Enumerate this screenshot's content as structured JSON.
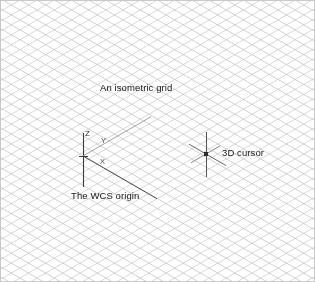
{
  "figure": {
    "width": 315,
    "height": 282,
    "background_color": "#ffffff",
    "border_color": "#c9c9c9"
  },
  "grid": {
    "type": "isometric",
    "description": "isometric-grid-lines",
    "line_color": "#b2b2b2",
    "line_color_secondary": "#bdbdbd",
    "angle_degrees": 30,
    "spacing_px": 8.6,
    "line_width": 0.6
  },
  "annotations": [
    {
      "id": "isometric-grid",
      "text": "An isometric grid",
      "x": 99,
      "y": 81
    },
    {
      "id": "wcs-origin",
      "text": "The WCS origin",
      "x": 70,
      "y": 189
    },
    {
      "id": "3d-cursor",
      "text": "3D cursor",
      "x": 221,
      "y": 146
    }
  ],
  "wcs_origin": {
    "label": "The WCS origin",
    "origin_x": 82,
    "origin_y": 155,
    "axis_color": "#3c3c3c",
    "axis_color_faint": "#8c8c8c",
    "axes": [
      {
        "name": "Z",
        "label": "Z",
        "label_x": 84,
        "label_y": 129,
        "direction": "up"
      },
      {
        "name": "Y",
        "label": "Y",
        "label_x": 100,
        "label_y": 136,
        "direction": "up-right"
      },
      {
        "name": "X",
        "label": "X",
        "label_x": 99,
        "label_y": 157,
        "direction": "down-right"
      }
    ]
  },
  "cursor_3d": {
    "label": "3D cursor",
    "center_x": 205,
    "center_y": 153,
    "marker_color": "#2b2b2b",
    "marker_size": 4,
    "crosshair_color": "#555555"
  }
}
